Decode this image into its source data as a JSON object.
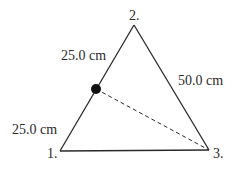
{
  "diagram": {
    "type": "triangle-charge-configuration",
    "vertices": [
      {
        "id": "1",
        "label": "1.",
        "x": 60,
        "y": 151
      },
      {
        "id": "2",
        "label": "2.",
        "x": 134,
        "y": 25
      },
      {
        "id": "3",
        "label": "3.",
        "x": 209,
        "y": 150
      }
    ],
    "edge_labels": {
      "upper_left": "25.0 cm",
      "lower_left": "25.0 cm",
      "right": "50.0 cm"
    },
    "midpoint_marker": {
      "x": 96,
      "y": 89,
      "radius": 5,
      "color": "#111111"
    },
    "dashed_line": {
      "from": "midpoint",
      "to": "3"
    },
    "colors": {
      "line": "#2a2a2a",
      "text": "#2a2a2a",
      "background": "#ffffff"
    }
  }
}
